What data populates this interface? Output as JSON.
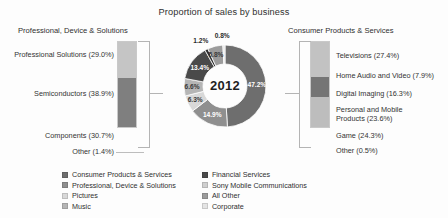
{
  "chart_data": {
    "type": "pie",
    "title": "Proportion of sales by business",
    "subtitle": "",
    "xlabel": "",
    "ylabel": "",
    "center_label": "2012",
    "legend_position": "bottom",
    "grid": false,
    "categories": [
      "Consumer Products & Services",
      "Professional, Device & Solutions",
      "Pictures",
      "Music",
      "Financial Services",
      "Sony Mobile Communications",
      "All Other",
      "Corporate"
    ],
    "values": [
      47.2,
      14.9,
      6.3,
      6.6,
      13.4,
      1.2,
      5.8,
      0.8
    ],
    "value_labels": [
      "47.2%",
      "14.9%",
      "6.3%",
      "6.6%",
      "13.4%",
      "1.2%",
      "5.8%",
      "0.8%"
    ],
    "colors": [
      "#6e6e6e",
      "#8f8f8f",
      "#d8d8d8",
      "#b5b5b5",
      "#4a4a4a",
      "#2f2f2f",
      "#9c9c9c",
      "#e4e4e4"
    ],
    "breakdowns": [
      {
        "name": "Professional, Device & Solutions",
        "side": "left",
        "items": [
          {
            "label": "Professional Solutions (29.0%)",
            "value": 29.0,
            "color": "#c5c5c5"
          },
          {
            "label": "Semiconductors (38.9%)",
            "value": 38.9,
            "color": "#7f7f7f"
          },
          {
            "label": "Components (30.7%)",
            "value": 30.7,
            "color": "#ffffff"
          },
          {
            "label": "Other (1.4%)",
            "value": 1.4,
            "color": "#ffffff"
          }
        ]
      },
      {
        "name": "Consumer Products & Services",
        "side": "right",
        "items": [
          {
            "label": "Televisions (27.4%)",
            "value": 27.4,
            "color": "#c2c2c2"
          },
          {
            "label": "Home Audio and Video (7.9%)",
            "value": 7.9,
            "color": "#ffffff"
          },
          {
            "label": "Digital Imaging (16.3%)",
            "value": 16.3,
            "color": "#757575"
          },
          {
            "label": "Personal and Mobile\nProducts (23.6%)",
            "value": 23.6,
            "color": "#bdbdbd"
          },
          {
            "label": "Game (24.3%)",
            "value": 24.3,
            "color": "#ffffff"
          },
          {
            "label": "Other (0.5%)",
            "value": 0.5,
            "color": "#ffffff"
          }
        ]
      }
    ]
  },
  "title": "Proportion of sales by business",
  "headings": {
    "left": "Professional, Device & Solutions",
    "right": "Consumer Products & Services"
  },
  "donut": {
    "center": "2012",
    "slice_labels": {
      "s1": "47.2%",
      "s2": "14.9%",
      "s3": "6.3%",
      "s4": "6.6%",
      "s5": "13.4%",
      "s6": "1.2%",
      "s7": "5.8%",
      "s8": "0.8%"
    }
  },
  "left_labels": {
    "l0": "Professional Solutions (29.0%)",
    "l1": "Semiconductors (38.9%)",
    "l2": "Components (30.7%)",
    "l3": "Other (1.4%)"
  },
  "right_labels": {
    "r0": "Televisions (27.4%)",
    "r1": "Home Audio and Video (7.9%)",
    "r2": "Digital Imaging (16.3%)",
    "r3": "Personal and Mobile\nProducts (23.6%)",
    "r4": "Game (24.3%)",
    "r5": "Other (0.5%)"
  },
  "legend": {
    "col1": [
      {
        "label": "Consumer Products & Services",
        "color": "#6e6e6e"
      },
      {
        "label": "Professional, Device & Solutions",
        "color": "#8f8f8f"
      },
      {
        "label": "Pictures",
        "color": "#d8d8d8"
      },
      {
        "label": "Music",
        "color": "#b5b5b5"
      }
    ],
    "col2": [
      {
        "label": "Financial Services",
        "color": "#4a4a4a"
      },
      {
        "label": "Sony Mobile Communications",
        "color": "#cfcfcf"
      },
      {
        "label": "All Other",
        "color": "#9c9c9c"
      },
      {
        "label": "Corporate",
        "color": "#e4e4e4"
      }
    ]
  }
}
